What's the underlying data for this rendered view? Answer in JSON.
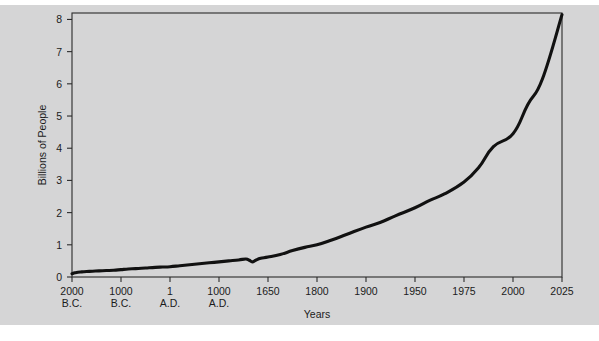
{
  "chart_data": {
    "type": "line",
    "title": "",
    "xlabel": "Years",
    "ylabel": "Billions of People",
    "grid": false,
    "legend": "none",
    "ylim": [
      0,
      8.2
    ],
    "y_ticks": [
      0,
      1,
      2,
      3,
      4,
      5,
      6,
      7,
      8
    ],
    "y_tick_labels": [
      "0",
      "1",
      "2",
      "3",
      "4",
      "5",
      "6",
      "7",
      "8"
    ],
    "x_scale": "categorical-nonlinear",
    "x_ticks": [
      {
        "line1": "2000",
        "line2": "B.C."
      },
      {
        "line1": "1000",
        "line2": "B.C."
      },
      {
        "line1": "1",
        "line2": "A.D."
      },
      {
        "line1": "1000",
        "line2": "A.D."
      },
      {
        "line1": "1650",
        "line2": ""
      },
      {
        "line1": "1800",
        "line2": ""
      },
      {
        "line1": "1900",
        "line2": ""
      },
      {
        "line1": "1950",
        "line2": ""
      },
      {
        "line1": "1975",
        "line2": ""
      },
      {
        "line1": "2000",
        "line2": ""
      },
      {
        "line1": "2025",
        "line2": ""
      }
    ],
    "series": [
      {
        "name": "World Population",
        "color": "#111111",
        "x_positions": [
          0.0,
          0.06,
          0.12,
          0.2,
          0.3,
          0.42,
          0.55,
          0.7,
          0.85,
          1.0,
          1.15,
          1.3,
          1.5,
          1.7,
          1.85,
          2.0,
          2.2,
          2.4,
          2.6,
          2.8,
          3.0,
          3.2,
          3.4,
          3.55,
          3.62,
          3.68,
          3.75,
          3.85,
          4.0,
          4.25,
          4.5,
          4.75,
          5.0,
          5.3,
          5.6,
          6.0,
          6.3,
          6.6,
          7.0,
          7.3,
          7.6,
          8.0,
          8.3,
          8.6,
          9.0,
          9.3,
          9.6,
          10.0
        ],
        "values": [
          0.1,
          0.13,
          0.15,
          0.16,
          0.17,
          0.18,
          0.19,
          0.2,
          0.21,
          0.23,
          0.25,
          0.26,
          0.28,
          0.3,
          0.31,
          0.32,
          0.35,
          0.38,
          0.41,
          0.44,
          0.47,
          0.5,
          0.53,
          0.56,
          0.52,
          0.47,
          0.52,
          0.58,
          0.62,
          0.7,
          0.82,
          0.92,
          1.0,
          1.15,
          1.32,
          1.55,
          1.7,
          1.9,
          2.15,
          2.38,
          2.58,
          2.95,
          3.4,
          4.05,
          4.45,
          5.35,
          6.15,
          8.15
        ],
        "annotated_points": [
          {
            "x": "2000 B.C.",
            "y": 0.1
          },
          {
            "x": "1 A.D.",
            "y": 0.3
          },
          {
            "x": "1650",
            "y": 0.55
          },
          {
            "x": "1800",
            "y": 1.0
          },
          {
            "x": "1900",
            "y": 1.65
          },
          {
            "x": "1950",
            "y": 2.55
          },
          {
            "x": "1975",
            "y": 4.05
          },
          {
            "x": "2000",
            "y": 6.1
          },
          {
            "x": "2025",
            "y": 8.15
          }
        ],
        "notes": "Dip before 1650 represents the Black Death population decline"
      }
    ]
  }
}
